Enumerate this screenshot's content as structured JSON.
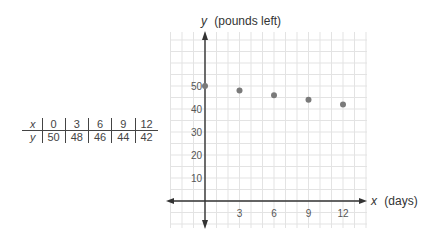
{
  "table": {
    "x_label": "x",
    "y_label": "y",
    "x_values": [
      "0",
      "3",
      "6",
      "9",
      "12"
    ],
    "y_values": [
      "50",
      "48",
      "46",
      "44",
      "42"
    ]
  },
  "chart": {
    "y_axis_var": "y",
    "y_axis_title": "(pounds left)",
    "x_axis_var": "x",
    "x_axis_title": "(days)",
    "y_ticks": [
      "10",
      "20",
      "30",
      "40",
      "50"
    ],
    "x_ticks": [
      "3",
      "6",
      "9",
      "12"
    ],
    "point_color": "#7a7a7a",
    "grid_color": "#e3e3e3",
    "axis_color": "#333333"
  },
  "chart_data": {
    "type": "scatter",
    "title": "",
    "xlabel": "x (days)",
    "ylabel": "y (pounds left)",
    "x": [
      0,
      3,
      6,
      9,
      12
    ],
    "y": [
      50,
      48,
      46,
      44,
      42
    ],
    "x_ticks": [
      3,
      6,
      9,
      12
    ],
    "y_ticks": [
      10,
      20,
      30,
      40,
      50
    ],
    "xlim": [
      -9,
      14
    ],
    "ylim": [
      -12,
      73
    ],
    "grid": true,
    "legend": null,
    "table": {
      "x": [
        0,
        3,
        6,
        9,
        12
      ],
      "y": [
        50,
        48,
        46,
        44,
        42
      ]
    }
  }
}
